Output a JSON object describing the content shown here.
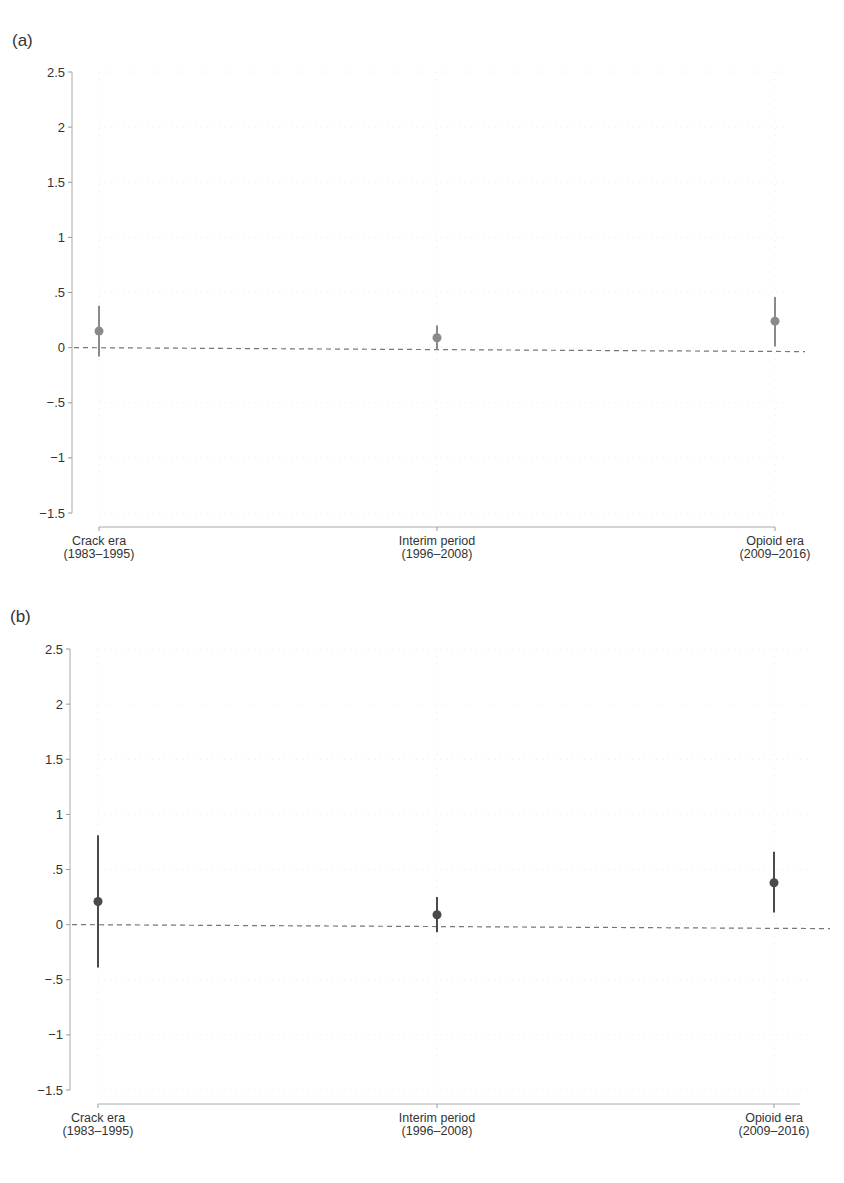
{
  "chart_data": [
    {
      "panel": "(a)",
      "type": "scatter",
      "subtype": "point-estimate-with-confidence-interval",
      "categories": [
        "Crack era (1983–1995)",
        "Interim period (1996–2008)",
        "Opioid era (2009–2016)"
      ],
      "category_lines": [
        [
          "Crack era",
          "(1983–1995)"
        ],
        [
          "Interim period",
          "(1996–2008)"
        ],
        [
          "Opioid era",
          "(2009–2016)"
        ]
      ],
      "series": [
        {
          "name": "estimate",
          "values": [
            0.15,
            0.09,
            0.24
          ],
          "ci_lower": [
            -0.08,
            -0.02,
            0.01
          ],
          "ci_upper": [
            0.38,
            0.2,
            0.46
          ],
          "color": "#8a8a8a"
        }
      ],
      "reference_line": 0,
      "yticks": [
        "2.5",
        "2",
        "1.5",
        "1",
        ".5",
        "0",
        "-.5",
        "-1",
        "-1.5"
      ],
      "ytick_values": [
        2.5,
        2,
        1.5,
        1,
        0.5,
        0,
        -0.5,
        -1,
        -1.5
      ],
      "ylim": [
        -1.5,
        2.5
      ],
      "title": "",
      "xlabel": "",
      "ylabel": "",
      "grid": true
    },
    {
      "panel": "(b)",
      "type": "scatter",
      "subtype": "point-estimate-with-confidence-interval",
      "categories": [
        "Crack era (1983–1995)",
        "Interim period (1996–2008)",
        "Opioid era (2009–2016)"
      ],
      "category_lines": [
        [
          "Crack era",
          "(1983–1995)"
        ],
        [
          "Interim period",
          "(1996–2008)"
        ],
        [
          "Opioid era",
          "(2009–2016)"
        ]
      ],
      "series": [
        {
          "name": "estimate",
          "values": [
            0.21,
            0.09,
            0.38
          ],
          "ci_lower": [
            -0.39,
            -0.07,
            0.11
          ],
          "ci_upper": [
            0.81,
            0.25,
            0.66
          ],
          "color": "#4a4a4a"
        }
      ],
      "reference_line": 0,
      "yticks": [
        "2.5",
        "2",
        "1.5",
        "1",
        ".5",
        "0",
        "-.5",
        "-1",
        "-1.5"
      ],
      "ytick_values": [
        2.5,
        2,
        1.5,
        1,
        0.5,
        0,
        -0.5,
        -1,
        -1.5
      ],
      "ylim": [
        -1.5,
        2.5
      ],
      "title": "",
      "xlabel": "",
      "ylabel": "",
      "grid": true
    }
  ],
  "panels": [
    {
      "label": "(a)",
      "layout": {
        "label_x": 12,
        "label_y": 46,
        "yaxis_x": 72,
        "y_top": 72,
        "y_bottom": 513,
        "xaxis_y": 527,
        "x_left": 99,
        "x_right": 775,
        "cat_x": [
          99,
          437,
          775
        ],
        "zero_right_drop": 4
      }
    },
    {
      "label": "(b)",
      "layout": {
        "label_x": 10,
        "label_y": 622,
        "yaxis_x": 70,
        "y_top": 649,
        "y_bottom": 1090,
        "xaxis_y": 1104,
        "x_left": 98,
        "x_right": 800,
        "cat_x": [
          98,
          437,
          774
        ],
        "zero_right_drop": 4
      }
    }
  ]
}
